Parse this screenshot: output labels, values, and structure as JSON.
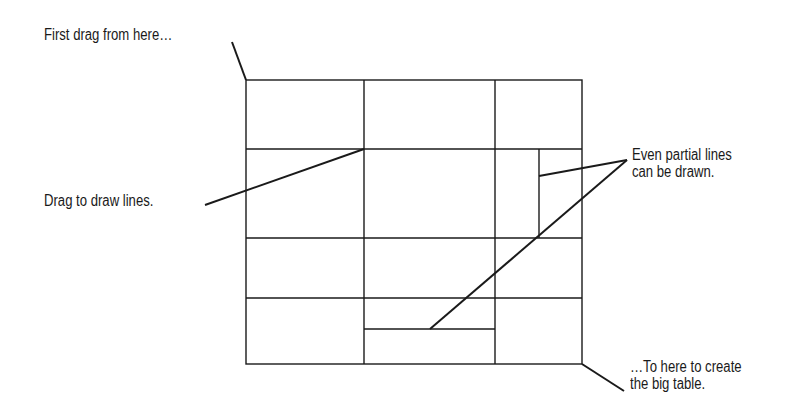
{
  "diagram": {
    "stroke_color": "#1a1a1a",
    "background": "#ffffff",
    "table": {
      "outer": {
        "x": 246,
        "y": 80,
        "width": 336,
        "height": 284
      },
      "vertical_lines": [
        {
          "x": 364,
          "y1": 80,
          "y2": 364
        },
        {
          "x": 495,
          "y1": 80,
          "y2": 364
        },
        {
          "x": 539,
          "y1": 149,
          "y2": 238
        }
      ],
      "horizontal_lines": [
        {
          "y": 149,
          "x1": 246,
          "x2": 582
        },
        {
          "y": 238,
          "x1": 246,
          "x2": 582
        },
        {
          "y": 298,
          "x1": 246,
          "x2": 582
        },
        {
          "y": 329,
          "x1": 364,
          "x2": 495
        }
      ]
    },
    "callouts": [
      {
        "id": "start",
        "lines": [
          "First drag from here…"
        ],
        "x": 44,
        "y": 26,
        "leader": [
          [
            232,
            42
          ],
          [
            246,
            80
          ]
        ]
      },
      {
        "id": "draw",
        "lines": [
          "Drag to draw lines."
        ],
        "x": 44,
        "y": 192,
        "leader": [
          [
            205,
            205
          ],
          [
            364,
            149
          ]
        ]
      },
      {
        "id": "partial",
        "lines": [
          "Even partial lines",
          "can be drawn."
        ],
        "x": 632,
        "y": 146,
        "leader": [
          [
            539,
            176
          ],
          [
            627,
            160
          ],
          [
            430,
            329
          ]
        ]
      },
      {
        "id": "end",
        "lines": [
          "…To here to create",
          "the big table."
        ],
        "x": 630,
        "y": 358,
        "leader": [
          [
            582,
            364
          ],
          [
            624,
            391
          ]
        ]
      }
    ]
  },
  "labels": {
    "start": [
      "First drag from here…"
    ],
    "draw": [
      "Drag to draw lines."
    ],
    "partial": [
      "Even partial lines",
      "can be drawn."
    ],
    "end": [
      "…To here to create",
      "the big table."
    ]
  }
}
